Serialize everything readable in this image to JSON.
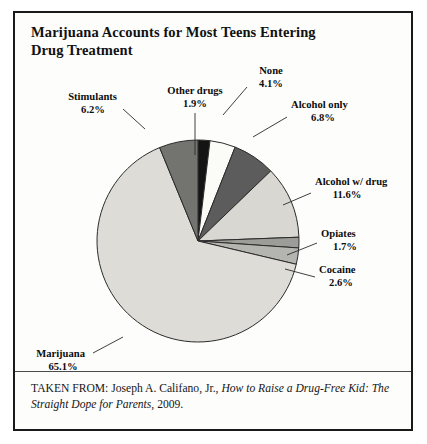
{
  "figure": {
    "title": "Marijuana Accounts for Most Teens Entering Drug Treatment",
    "title_line1": "Marijuana Accounts for Most Teens Entering",
    "title_line2": "Drug Treatment",
    "caption_prefix": "TAKEN FROM: Joseph A. Califano, Jr., ",
    "caption_italic": "How to Raise a Drug-Free Kid: The Straight Dope for Parents",
    "caption_suffix": ", 2009.",
    "border_color": "#1a1a1a",
    "background_color": "#fdfdfc"
  },
  "chart_data": {
    "type": "pie",
    "title": "Marijuana Accounts for Most Teens Entering Drug Treatment",
    "xlabel": "",
    "ylabel": "",
    "units": "percent",
    "start_angle_deg": 0,
    "direction": "clockwise",
    "legend": "none",
    "grid": false,
    "categories": [
      "Other drugs",
      "None",
      "Alcohol only",
      "Alcohol w/ drug",
      "Opiates",
      "Cocaine",
      "Marijuana",
      "Stimulants"
    ],
    "values": [
      1.9,
      4.1,
      6.8,
      11.6,
      1.7,
      2.6,
      65.1,
      6.2
    ],
    "slices": [
      {
        "label": "Other drugs",
        "value": 1.9,
        "pct_text": "1.9%",
        "color": "#141414",
        "start_deg": 0.0,
        "end_deg": 6.84
      },
      {
        "label": "None",
        "value": 4.1,
        "pct_text": "4.1%",
        "color": "#fbfbf8",
        "start_deg": 6.84,
        "end_deg": 21.6
      },
      {
        "label": "Alcohol only",
        "value": 6.8,
        "pct_text": "6.8%",
        "color": "#5c5c5c",
        "start_deg": 21.6,
        "end_deg": 46.08
      },
      {
        "label": "Alcohol w/ drug",
        "value": 11.6,
        "pct_text": "11.6%",
        "color": "#d8d7d2",
        "start_deg": 46.08,
        "end_deg": 87.84
      },
      {
        "label": "Opiates",
        "value": 1.7,
        "pct_text": "1.7%",
        "color": "#9c9c98",
        "start_deg": 87.84,
        "end_deg": 93.96
      },
      {
        "label": "Cocaine",
        "value": 2.6,
        "pct_text": "2.6%",
        "color": "#b4b4b0",
        "start_deg": 93.96,
        "end_deg": 103.32
      },
      {
        "label": "Marijuana",
        "value": 65.1,
        "pct_text": "65.1%",
        "color": "#dedcd6",
        "start_deg": 103.32,
        "end_deg": 337.68
      },
      {
        "label": "Stimulants",
        "value": 6.2,
        "pct_text": "6.2%",
        "color": "#737370",
        "start_deg": 337.68,
        "end_deg": 360.0
      }
    ],
    "total": 99.6
  },
  "labels": {
    "other_drugs": {
      "name": "Other drugs",
      "pct": "1.9%"
    },
    "none": {
      "name": "None",
      "pct": "4.1%"
    },
    "alcohol_only": {
      "name": "Alcohol only",
      "pct": "6.8%"
    },
    "alcohol_w_drug": {
      "name": "Alcohol w/ drug",
      "pct": "11.6%"
    },
    "opiates": {
      "name": "Opiates",
      "pct": "1.7%"
    },
    "cocaine": {
      "name": "Cocaine",
      "pct": "2.6%"
    },
    "marijuana": {
      "name": "Marijuana",
      "pct": "65.1%"
    },
    "stimulants": {
      "name": "Stimulants",
      "pct": "6.2%"
    }
  }
}
